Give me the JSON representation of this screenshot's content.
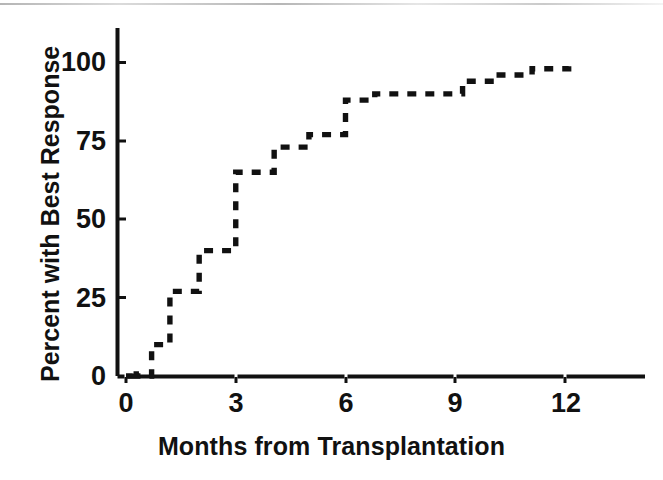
{
  "chart_data": {
    "type": "line",
    "style": "step-post-dashed",
    "title": "",
    "xlabel": "Months from Transplantation",
    "ylabel": "Percent with Best Response",
    "xlim": [
      -0.35,
      14.2
    ],
    "ylim": [
      0,
      108
    ],
    "xticks": [
      0,
      3,
      6,
      9,
      12
    ],
    "xticklabels": [
      "0",
      "3",
      "6",
      "9",
      "12"
    ],
    "yticks": [
      0,
      25,
      50,
      75,
      100
    ],
    "yticklabels": [
      "0",
      "25",
      "50",
      "75",
      "100"
    ],
    "grid": false,
    "legend": null,
    "line_color": "#111111",
    "axis_color": "#111111",
    "background": "#ffffff",
    "series": [
      {
        "name": "Cumulative percent with best response",
        "x": [
          0.0,
          0.18,
          0.28,
          0.7,
          1.2,
          2.0,
          3.0,
          4.05,
          5.0,
          6.0,
          6.8,
          9.2,
          10.1,
          11.1,
          12.1
        ],
        "y": [
          0,
          2,
          0,
          10,
          27,
          40,
          65,
          73,
          77,
          88,
          90,
          94,
          96,
          98,
          100
        ]
      }
    ],
    "steps": [
      {
        "month": 0.18,
        "percent": 2
      },
      {
        "month": 0.7,
        "percent": 10
      },
      {
        "month": 1.2,
        "percent": 27
      },
      {
        "month": 2.0,
        "percent": 40
      },
      {
        "month": 3.0,
        "percent": 65
      },
      {
        "month": 4.05,
        "percent": 73
      },
      {
        "month": 5.0,
        "percent": 77
      },
      {
        "month": 6.0,
        "percent": 88
      },
      {
        "month": 6.8,
        "percent": 90
      },
      {
        "month": 9.2,
        "percent": 94
      },
      {
        "month": 10.1,
        "percent": 96
      },
      {
        "month": 11.1,
        "percent": 98
      },
      {
        "month": 12.1,
        "percent": 100
      }
    ]
  },
  "axes": {
    "x_title": "Months from Transplantation",
    "y_title": "Percent with Best Response",
    "x_ticks": [
      {
        "label": "0",
        "value": 0
      },
      {
        "label": "3",
        "value": 3
      },
      {
        "label": "6",
        "value": 6
      },
      {
        "label": "9",
        "value": 9
      },
      {
        "label": "12",
        "value": 12
      }
    ],
    "y_ticks": [
      {
        "label": "100",
        "value": 100
      },
      {
        "label": "75",
        "value": 75
      },
      {
        "label": "50",
        "value": 50
      },
      {
        "label": "25",
        "value": 25
      },
      {
        "label": "0",
        "value": 0
      }
    ]
  }
}
